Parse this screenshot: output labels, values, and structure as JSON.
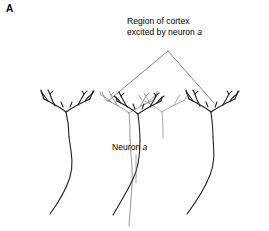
{
  "figure": {
    "panel_label": "A",
    "background_color": "#ffffff",
    "width": 269,
    "height": 231
  },
  "labels": {
    "region_caption_line1": "Region of cortex",
    "region_caption_line2_prefix": "excited by neuron ",
    "region_caption_line2_italic": "a",
    "neuron_caption_prefix": "Neuron ",
    "neuron_caption_italic": "a"
  },
  "colors": {
    "neuron_black": "#1a1a1a",
    "neuron_gray": "#8c8c8c",
    "wedge_line": "#6e6e6e",
    "leader_line": "#8c8c8c",
    "text": "#000000"
  },
  "diagram": {
    "type": "neuroanatomy-schematic",
    "elements": [
      {
        "name": "wedge-apex",
        "x": 168,
        "y": 51
      },
      {
        "name": "wedge-left-end",
        "x": 108,
        "y": 101
      },
      {
        "name": "wedge-right-end",
        "x": 214,
        "y": 103
      },
      {
        "name": "leader-line-top",
        "x": 136,
        "y": 155
      },
      {
        "name": "leader-line-bottom",
        "x": 136,
        "y": 182
      }
    ],
    "neurons": [
      {
        "name": "neuron-left-black",
        "color": "neuron_black",
        "soma_x": 68,
        "soma_y": 136
      },
      {
        "name": "neuron-center-gray",
        "color": "neuron_gray",
        "soma_x": 130,
        "soma_y": 140,
        "is_neuron_a": true
      },
      {
        "name": "neuron-center2-gray",
        "color": "neuron_gray",
        "soma_x": 162,
        "soma_y": 136,
        "is_neuron_a": false
      },
      {
        "name": "neuron-right-black",
        "color": "neuron_black",
        "soma_x": 140,
        "soma_y": 140
      },
      {
        "name": "neuron-far-right-black",
        "color": "neuron_black",
        "soma_x": 212,
        "soma_y": 136
      }
    ]
  }
}
